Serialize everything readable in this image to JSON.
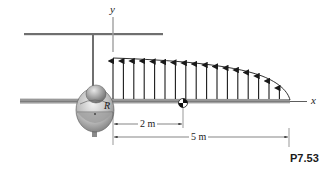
{
  "figure": {
    "id_label": "P7.53",
    "axes": {
      "x_label": "x",
      "y_label": "y"
    },
    "point_label": "R",
    "dimensions": [
      {
        "label": "2 m",
        "from_m": 0,
        "to_m": 2
      },
      {
        "label": "5 m",
        "from_m": 0,
        "to_m": 5
      }
    ],
    "distributed_load": {
      "direction": "upward",
      "arrow_count": 17,
      "span_m": 5,
      "shape": "decreasing curve, max at root, zero at wing tip"
    },
    "elements": [
      "horizontal-tail",
      "vertical-stabilizer",
      "fuselage-front-view",
      "wing",
      "center-of-mass-marker"
    ],
    "colors": {
      "line": "#1a1a1a",
      "structure": "#8a8a8a",
      "axis": "#9a9a9a"
    }
  }
}
